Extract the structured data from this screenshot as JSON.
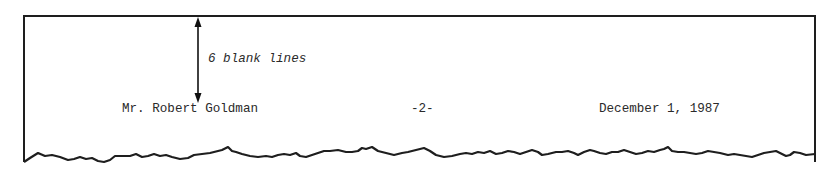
{
  "annotation": {
    "label": "6 blank lines",
    "arrow": "double-headed vertical arrow"
  },
  "heading": {
    "recipient": "Mr. Robert Goldman",
    "page_number": "-2-",
    "date": "December 1, 1987"
  },
  "colors": {
    "ink": "#222222",
    "paper": "#ffffff"
  }
}
